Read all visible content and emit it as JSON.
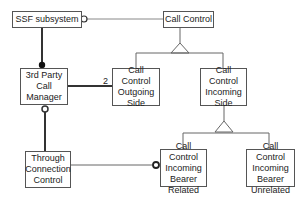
{
  "diagram": {
    "nodes": {
      "ssf": "SSF subsystem",
      "call_control": "Call Control",
      "third_party": "3rd Party Call Manager",
      "outgoing": "Call Control Outgoing Side",
      "incoming": "Call Control Incoming Side",
      "through": "Through Connection Control",
      "bearer_related": "Call Control Incoming Bearer Related",
      "bearer_unrelated": "Call Control Incoming Bearer Unrelated"
    },
    "multiplicity_label": "2"
  }
}
